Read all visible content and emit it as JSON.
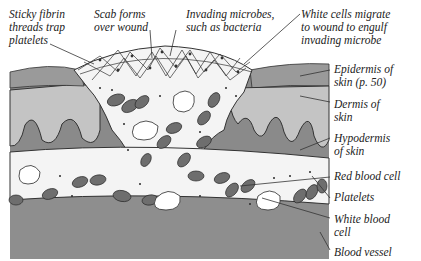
{
  "diagram": {
    "labels_top": [
      {
        "id": "fibrin",
        "lines": [
          "Sticky fibrin",
          "threads trap",
          "platelets"
        ]
      },
      {
        "id": "scab",
        "lines": [
          "Scab forms",
          "over wound"
        ]
      },
      {
        "id": "microbes",
        "lines": [
          "Invading microbes,",
          "such as bacteria"
        ]
      },
      {
        "id": "white-cells-migrate",
        "lines": [
          "White cells migrate",
          "to wound to engulf",
          "invading microbe"
        ]
      }
    ],
    "labels_right": [
      {
        "id": "epidermis",
        "lines": [
          "Epidermis of",
          "skin (p. 50)"
        ]
      },
      {
        "id": "dermis",
        "lines": [
          "Dermis of",
          "skin"
        ]
      },
      {
        "id": "hypodermis",
        "lines": [
          "Hypodermis",
          "of skin"
        ]
      },
      {
        "id": "red-blood-cell",
        "lines": [
          "Red blood cell"
        ]
      },
      {
        "id": "platelets",
        "lines": [
          "Platelets"
        ]
      },
      {
        "id": "white-blood-cell",
        "lines": [
          "White blood",
          "cell"
        ]
      },
      {
        "id": "blood-vessel",
        "lines": [
          "Blood vessel"
        ]
      }
    ],
    "colors": {
      "epidermis": "#9a9a9a",
      "dermis": "#c4c4c4",
      "hypodermis": "#8a8a8a",
      "vessel_wall_bottom": "#8e8e8e",
      "plasma": "#f4f4f4",
      "red_cell": "#6e6e6e",
      "outline": "#2a2a2a"
    }
  }
}
